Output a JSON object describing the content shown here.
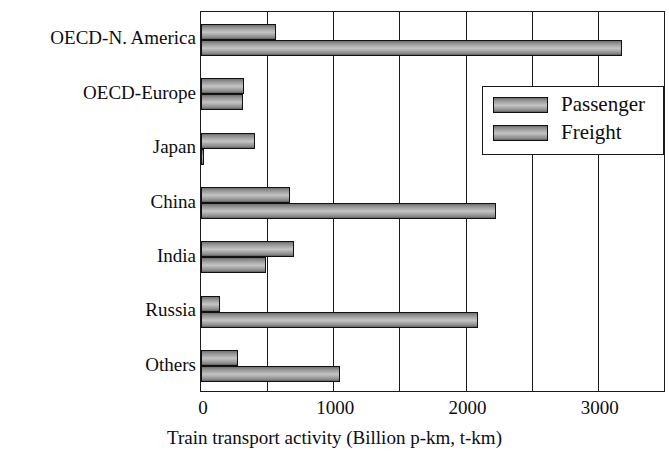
{
  "chart_data": {
    "type": "bar",
    "orientation": "horizontal",
    "title": "",
    "xlabel": "Train transport activity (Billion p-km, t-km)",
    "ylabel": "",
    "categories": [
      "OECD-N. America",
      "OECD-Europe",
      "Japan",
      "China",
      "India",
      "Russia",
      "Others"
    ],
    "series": [
      {
        "name": "Passenger",
        "values": [
          565,
          325,
          410,
          675,
          700,
          140,
          280
        ]
      },
      {
        "name": "Freight",
        "values": [
          3180,
          320,
          25,
          2230,
          490,
          2095,
          1050
        ]
      }
    ],
    "xlim": [
      0,
      3500
    ],
    "xticks": [
      0,
      1000,
      2000,
      3000
    ],
    "xtick_labels": [
      "0",
      "1000",
      "2000",
      "3000"
    ],
    "gridline_step": 500,
    "grid": true,
    "legend": {
      "position": "upper-right-inside",
      "entries": [
        "Passenger",
        "Freight"
      ]
    },
    "colors": {
      "bar_fill_light": "#c4c4c4",
      "bar_fill_dark": "#5f5f5f",
      "outline": "#111111",
      "axis": "#1a1a1a",
      "background": "#ffffff",
      "text": "#0d0d0d"
    }
  }
}
